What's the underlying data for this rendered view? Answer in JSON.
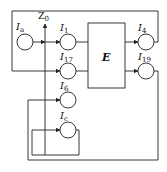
{
  "diagram": {
    "type": "block-circuit",
    "axis_label": {
      "main": "Z",
      "sub": "0"
    },
    "block": {
      "label": "E"
    },
    "nodes": [
      {
        "id": "Ia",
        "main": "I",
        "sub": "a"
      },
      {
        "id": "I1",
        "main": "I",
        "sub": "1"
      },
      {
        "id": "I17",
        "main": "I",
        "sub": "17"
      },
      {
        "id": "I6",
        "main": "I",
        "sub": "6"
      },
      {
        "id": "Ic",
        "main": "I",
        "sub": "c"
      },
      {
        "id": "I4",
        "main": "I",
        "sub": "4"
      },
      {
        "id": "I19",
        "main": "I",
        "sub": "19"
      }
    ],
    "edges": [
      {
        "from": "Ia",
        "to": "I1"
      },
      {
        "from": "I1",
        "to": "E"
      },
      {
        "from": "I17",
        "to": "E"
      },
      {
        "from": "E",
        "to": "I4"
      },
      {
        "from": "E",
        "to": "I19"
      },
      {
        "from": "I4",
        "to": "I17",
        "note": "feedback via top loop"
      },
      {
        "from": "I19",
        "to": "I6",
        "note": "feedback via bottom loop"
      },
      {
        "from": "Ic",
        "to": "Ic",
        "note": "self loop"
      }
    ]
  }
}
